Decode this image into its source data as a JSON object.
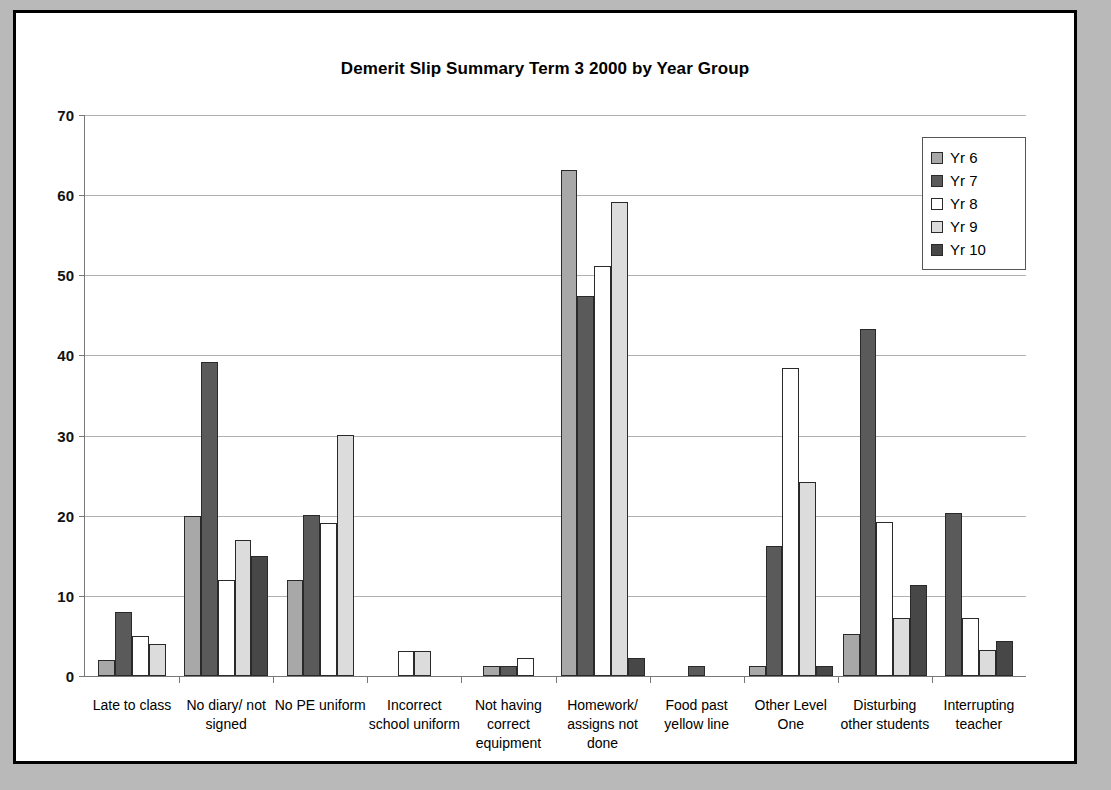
{
  "chart_data": {
    "type": "bar",
    "title": "Demerit Slip Summary Term 3 2000  by Year Group",
    "xlabel": "",
    "ylabel": "",
    "ylim": [
      0,
      70
    ],
    "ytick_step": 10,
    "yticks": [
      "0",
      "10",
      "20",
      "30",
      "40",
      "50",
      "60",
      "70"
    ],
    "grid": true,
    "legend_position": "top-right",
    "categories": [
      "Late to class",
      "No diary/ not signed",
      "No PE uniform",
      "Incorrect school uniform",
      "Not having correct equipment",
      "Homework/ assigns not done",
      "Food past yellow line",
      "Other Level One",
      "Disturbing other students",
      "Interrupting teacher"
    ],
    "series": [
      {
        "name": "Yr 6",
        "color": "#a8a8a8",
        "values": [
          2,
          20,
          12,
          0,
          1.3,
          63.2,
          0,
          1.3,
          5.3,
          0
        ]
      },
      {
        "name": "Yr 7",
        "color": "#5a5a5a",
        "values": [
          8,
          39.2,
          20.1,
          0,
          1.3,
          47.4,
          1.3,
          16.2,
          43.3,
          20.3
        ]
      },
      {
        "name": "Yr 8",
        "color": "#ffffff",
        "values": [
          5,
          12,
          19.1,
          3.1,
          2.2,
          51.2,
          0,
          38.4,
          19.2,
          7.3
        ]
      },
      {
        "name": "Yr 9",
        "color": "#dcdcdc",
        "values": [
          4,
          17,
          30.1,
          3.1,
          0,
          59.2,
          0,
          24.2,
          7.3,
          3.3
        ]
      },
      {
        "name": "Yr 10",
        "color": "#474747",
        "values": [
          0,
          15,
          0,
          0,
          0,
          2.2,
          0,
          1.3,
          11.3,
          4.4
        ]
      }
    ]
  },
  "legend": {
    "items": [
      {
        "label": "Yr 6"
      },
      {
        "label": "Yr 7"
      },
      {
        "label": "Yr 8"
      },
      {
        "label": "Yr 9"
      },
      {
        "label": "Yr 10"
      }
    ]
  }
}
